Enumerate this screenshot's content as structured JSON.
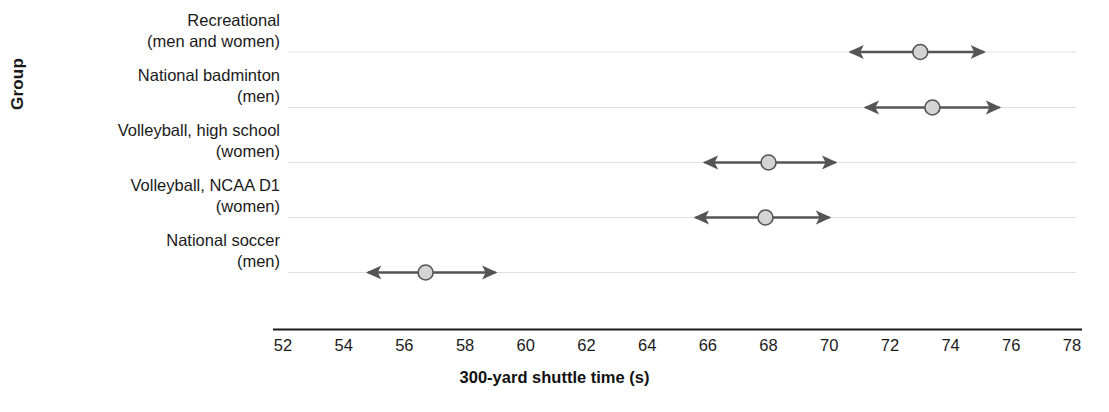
{
  "chart_data": {
    "type": "scatter",
    "title": "",
    "xlabel": "300-yard shuttle time (s)",
    "ylabel": "Group",
    "xlim": [
      52,
      78
    ],
    "xticks": [
      52,
      54,
      56,
      58,
      60,
      62,
      64,
      66,
      68,
      70,
      72,
      74,
      76,
      78
    ],
    "xticklabels": [
      "52",
      "54",
      "56",
      "58",
      "60",
      "62",
      "64",
      "66",
      "68",
      "70",
      "72",
      "74",
      "76",
      "78"
    ],
    "grid": "horizontal",
    "legend": "none",
    "marker_style": "circle with double-headed error bar (arrows)",
    "categories": [
      "Recreational\n(men and women)",
      "National badminton\n(men)",
      "Volleyball, high school\n(women)",
      "Volleyball, NCAA D1\n(women)",
      "National soccer\n(men)"
    ],
    "series": [
      {
        "name": "300-yard shuttle time",
        "points": [
          {
            "group": "Recreational (men and women)",
            "mean": 73.0,
            "low": 70.4,
            "high": 75.4
          },
          {
            "group": "National badminton (men)",
            "mean": 73.4,
            "low": 70.9,
            "high": 75.9
          },
          {
            "group": "Volleyball, high school (women)",
            "mean": 68.0,
            "low": 65.6,
            "high": 70.5
          },
          {
            "group": "Volleyball, NCAA D1 (women)",
            "mean": 67.9,
            "low": 65.3,
            "high": 70.3
          },
          {
            "group": "National soccer (men)",
            "mean": 56.7,
            "low": 54.5,
            "high": 59.3
          }
        ]
      }
    ],
    "colors": {
      "marker_fill": "#d4d4d4",
      "marker_edge": "#555555",
      "line": "#555555",
      "grid": "#e0e0e0",
      "axis": "#1a1a1a",
      "text": "#1a1a1a"
    }
  },
  "axis": {
    "y_title": "Group",
    "x_title": "300-yard shuttle time (s)",
    "x_ticks": [
      "52",
      "54",
      "56",
      "58",
      "60",
      "62",
      "64",
      "66",
      "68",
      "70",
      "72",
      "74",
      "76",
      "78"
    ]
  },
  "categories": [
    {
      "line1": "Recreational",
      "line2": "(men and women)"
    },
    {
      "line1": "National badminton",
      "line2": "(men)"
    },
    {
      "line1": "Volleyball, high school",
      "line2": "(women)"
    },
    {
      "line1": "Volleyball, NCAA D1",
      "line2": "(women)"
    },
    {
      "line1": "National soccer",
      "line2": "(men)"
    }
  ]
}
